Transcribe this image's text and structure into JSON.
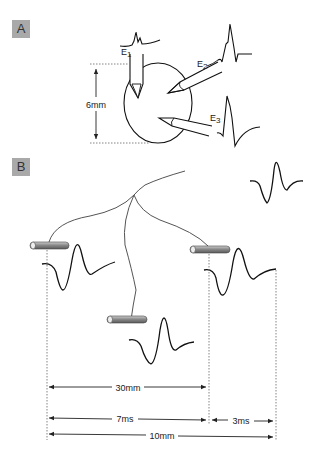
{
  "panel_a": {
    "label": "A",
    "electrodes": [
      {
        "name": "E",
        "sub": "1"
      },
      {
        "name": "E",
        "sub": "2"
      },
      {
        "name": "E",
        "sub": "3"
      }
    ],
    "diameter_label": "6mm"
  },
  "panel_b": {
    "label": "B",
    "dimensions": {
      "top_distance": "30mm",
      "time_left": "7ms",
      "time_right": "3ms",
      "bottom_distance": "10mm"
    }
  },
  "colors": {
    "label_box": "#a9a9a9",
    "line": "#111111",
    "nerve": "#555555",
    "electrode_fill": "#8a8a8a"
  }
}
